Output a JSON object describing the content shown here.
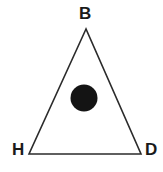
{
  "figure": {
    "type": "geometric-diagram",
    "shape": "triangle",
    "background_color": "#ffffff",
    "stroke_color": "#2b2b2b",
    "fill_color": "none",
    "stroke_width": 1.6,
    "width": 163,
    "height": 172
  },
  "triangle": {
    "name": "triangle-BHD",
    "vertices": [
      {
        "label": "B",
        "x": 86,
        "y": 29,
        "position": "apex-top"
      },
      {
        "label": "H",
        "x": 29,
        "y": 154,
        "position": "bottom-left"
      },
      {
        "label": "D",
        "x": 141,
        "y": 154,
        "position": "bottom-right"
      }
    ],
    "points_attribute": "86,29 29,154 141,154"
  },
  "labels": {
    "apex": "B",
    "bottom_left": "H",
    "bottom_right": "D",
    "color": "#1a1a1a",
    "font_weight": "bold",
    "font_size": "17px"
  },
  "interior_circle": {
    "name": "interior-dot",
    "cx": 84,
    "cy": 98,
    "r": 13.5,
    "fill": "#141414",
    "description": "solid black filled circle inside the triangle"
  }
}
